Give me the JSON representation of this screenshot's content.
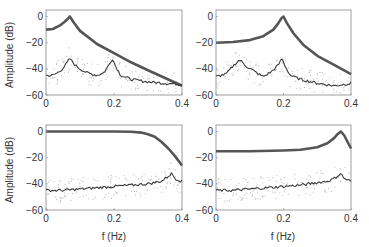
{
  "chart_data": [
    {
      "type": "line",
      "panel": "top-left",
      "title": "",
      "xlabel": "",
      "ylabel": "Amplitude (dB)",
      "xlim": [
        0,
        0.4
      ],
      "ylim": [
        -60,
        5
      ],
      "xticks": [
        "0",
        "0.2",
        "0.4"
      ],
      "yticks": [
        "0",
        "-20",
        "-40",
        "-60"
      ],
      "grid": false,
      "series": [
        {
          "name": "theoretical",
          "x": [
            0,
            0.02,
            0.04,
            0.055,
            0.065,
            0.07,
            0.08,
            0.1,
            0.15,
            0.2,
            0.25,
            0.3,
            0.35,
            0.4
          ],
          "y": [
            -10,
            -9.5,
            -7,
            -4,
            -1.5,
            0,
            -4,
            -11,
            -21,
            -28,
            -35,
            -41,
            -47,
            -53
          ]
        },
        {
          "name": "estimated",
          "x": [
            0,
            0.02,
            0.04,
            0.055,
            0.07,
            0.085,
            0.1,
            0.12,
            0.15,
            0.17,
            0.185,
            0.195,
            0.205,
            0.22,
            0.25,
            0.3,
            0.35,
            0.4
          ],
          "y": [
            -45,
            -45,
            -42,
            -38,
            -32,
            -37,
            -40,
            -43,
            -45,
            -43,
            -37,
            -32,
            -38,
            -45,
            -48,
            -50,
            -51,
            -52
          ]
        }
      ],
      "scatter_note": "light gray dots around estimated curve"
    },
    {
      "type": "line",
      "panel": "top-right",
      "xlim": [
        0,
        0.4
      ],
      "ylim": [
        -60,
        5
      ],
      "xticks": [
        "0",
        "0.2",
        "0.4"
      ],
      "yticks": [
        "0",
        "-20",
        "-40",
        "-60"
      ],
      "series": [
        {
          "name": "theoretical",
          "x": [
            0,
            0.05,
            0.1,
            0.14,
            0.17,
            0.185,
            0.195,
            0.2,
            0.21,
            0.23,
            0.26,
            0.3,
            0.35,
            0.4
          ],
          "y": [
            -20,
            -19.5,
            -18,
            -15,
            -10,
            -5,
            -1,
            0,
            -5,
            -13,
            -22,
            -30,
            -37,
            -44
          ]
        },
        {
          "name": "estimated",
          "x": [
            0,
            0.03,
            0.05,
            0.07,
            0.09,
            0.12,
            0.14,
            0.165,
            0.185,
            0.195,
            0.205,
            0.22,
            0.25,
            0.3,
            0.35,
            0.4
          ],
          "y": [
            -46,
            -44,
            -38,
            -33,
            -38,
            -43,
            -46,
            -42,
            -37,
            -32,
            -38,
            -45,
            -48,
            -51,
            -53,
            -51
          ]
        }
      ]
    },
    {
      "type": "line",
      "panel": "bottom-left",
      "xlabel": "f (Hz)",
      "ylabel": "Amplitude (dB)",
      "xlim": [
        0,
        0.4
      ],
      "ylim": [
        -60,
        5
      ],
      "xticks": [
        "0",
        "0.2",
        "0.4"
      ],
      "yticks": [
        "0",
        "-20",
        "-40",
        "-60"
      ],
      "series": [
        {
          "name": "theoretical",
          "x": [
            0,
            0.1,
            0.2,
            0.25,
            0.28,
            0.3,
            0.32,
            0.34,
            0.36,
            0.38,
            0.4
          ],
          "y": [
            0,
            0,
            0,
            -0.2,
            -0.8,
            -2,
            -4,
            -8,
            -13,
            -19,
            -26
          ]
        },
        {
          "name": "estimated",
          "x": [
            0,
            0.05,
            0.1,
            0.15,
            0.2,
            0.25,
            0.3,
            0.34,
            0.36,
            0.37,
            0.38,
            0.4
          ],
          "y": [
            -45,
            -45,
            -44,
            -43,
            -42,
            -41,
            -40,
            -38,
            -34,
            -32,
            -36,
            -38
          ]
        }
      ]
    },
    {
      "type": "line",
      "panel": "bottom-right",
      "xlabel": "f (Hz)",
      "xlim": [
        0,
        0.4
      ],
      "ylim": [
        -60,
        5
      ],
      "xticks": [
        "0",
        "0.2",
        "0.4"
      ],
      "yticks": [
        "0",
        "-20",
        "-40",
        "-60"
      ],
      "series": [
        {
          "name": "theoretical",
          "x": [
            0,
            0.1,
            0.2,
            0.25,
            0.3,
            0.33,
            0.35,
            0.36,
            0.37,
            0.38,
            0.39,
            0.4
          ],
          "y": [
            -15,
            -15,
            -14.5,
            -14,
            -12,
            -9,
            -5,
            -2,
            0,
            -3,
            -8,
            -13
          ]
        },
        {
          "name": "estimated",
          "x": [
            0,
            0.05,
            0.1,
            0.15,
            0.2,
            0.25,
            0.3,
            0.33,
            0.35,
            0.365,
            0.37,
            0.38,
            0.4
          ],
          "y": [
            -45,
            -45,
            -44,
            -43,
            -42,
            -41,
            -39,
            -38,
            -36,
            -33,
            -32,
            -36,
            -38
          ]
        }
      ]
    }
  ],
  "labels": {
    "ylabel": "Amplitude (dB)",
    "xlabel": "f (Hz)"
  },
  "colors": {
    "theoretical": "#555555",
    "estimated": "#3a3a3a",
    "scatter": "#bbbbbb",
    "axes": "#888888"
  }
}
